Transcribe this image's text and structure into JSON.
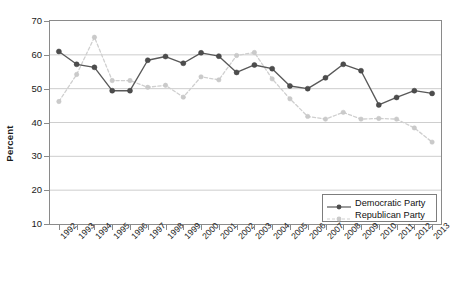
{
  "chart_data": {
    "type": "line",
    "title": "",
    "xlabel": "",
    "ylabel": "Percent",
    "ylim": [
      10,
      70
    ],
    "yticks": [
      10,
      20,
      30,
      40,
      50,
      60,
      70
    ],
    "grid": true,
    "legend_position": "bottom-right",
    "categories": [
      "1992",
      "1993",
      "1994",
      "1995",
      "1996",
      "1997",
      "1998",
      "1999",
      "2000",
      "2001",
      "2002",
      "2003",
      "2004",
      "2005",
      "2006",
      "2007",
      "2008",
      "2009",
      "2010",
      "2011",
      "2012",
      "2013"
    ],
    "series": [
      {
        "name": "Democratic Party",
        "color": "#595959",
        "marker": "filled-circle",
        "linestyle": "solid",
        "values": [
          61.0,
          57.2,
          56.3,
          49.4,
          49.4,
          58.4,
          59.5,
          57.5,
          60.6,
          59.6,
          54.8,
          57.0,
          55.9,
          50.8,
          50.0,
          53.2,
          57.2,
          55.3,
          45.2,
          47.4,
          49.4,
          48.6
        ]
      },
      {
        "name": "Republican Party",
        "color": "#cfcfcf",
        "marker": "filled-circle",
        "linestyle": "dashed",
        "values": [
          46.2,
          54.2,
          65.2,
          52.4,
          52.4,
          50.4,
          51.0,
          47.5,
          53.5,
          52.6,
          59.8,
          60.7,
          52.9,
          47.0,
          41.8,
          41.0,
          43.0,
          41.0,
          41.2,
          41.0,
          38.4,
          34.2
        ]
      }
    ]
  },
  "axes": {
    "y_label": "Percent",
    "y_tick_labels": [
      "70",
      "60",
      "50",
      "40",
      "30",
      "20",
      "10"
    ],
    "x_tick_labels": [
      "1992",
      "1993",
      "1994",
      "1995",
      "1996",
      "1997",
      "1998",
      "1999",
      "2000",
      "2001",
      "2002",
      "2003",
      "2004",
      "2005",
      "2006",
      "2007",
      "2008",
      "2009",
      "2010",
      "2011",
      "2012",
      "2013"
    ]
  },
  "legend": {
    "items": [
      {
        "label": "Democratic Party"
      },
      {
        "label": "Republican Party"
      }
    ]
  },
  "colors": {
    "democratic": "#595959",
    "republican": "#cfcfcf",
    "grid": "#c8c8c8",
    "axis": "#8a8a8a",
    "text": "#1a1a1a"
  }
}
